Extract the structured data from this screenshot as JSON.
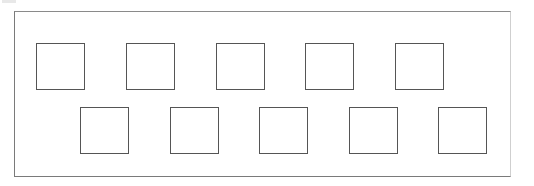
{
  "figure": {
    "frame": {
      "x": 14,
      "y": 11,
      "width": 497,
      "height": 166,
      "border_color": "#7a7a7a"
    },
    "square_size": {
      "width": 49,
      "height": 47
    },
    "square_border_color": "#555555",
    "rows": [
      {
        "name": "top-row",
        "squares": [
          {
            "x": 36,
            "y": 43
          },
          {
            "x": 126,
            "y": 43
          },
          {
            "x": 216,
            "y": 43
          },
          {
            "x": 305,
            "y": 43
          },
          {
            "x": 395,
            "y": 43
          }
        ]
      },
      {
        "name": "bottom-row",
        "squares": [
          {
            "x": 80,
            "y": 107
          },
          {
            "x": 170,
            "y": 107
          },
          {
            "x": 259,
            "y": 107
          },
          {
            "x": 349,
            "y": 107
          },
          {
            "x": 438,
            "y": 107
          }
        ]
      }
    ]
  }
}
